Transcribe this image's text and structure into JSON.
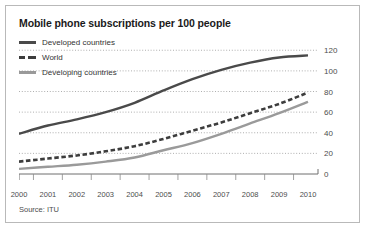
{
  "figure": {
    "title": "Mobile phone subscriptions per 100 people",
    "source": "Source: ITU",
    "border_color": "#b9b9b9",
    "background": "#ffffff"
  },
  "legend": {
    "position": "top-left",
    "items": [
      {
        "label": "Developed countries",
        "color": "#4a4a4a",
        "style": "solid",
        "swatch": "sw-solid-dark"
      },
      {
        "label": "World",
        "color": "#3d3d3d",
        "style": "dashed",
        "swatch": "sw-dashed-dark"
      },
      {
        "label": "Developing countries",
        "color": "#9a9a9a",
        "style": "solid",
        "swatch": "sw-solid-light"
      }
    ]
  },
  "chart_data": {
    "type": "line",
    "title": "Mobile phone subscriptions per 100 people",
    "xlabel": "",
    "ylabel": "",
    "x": [
      2000,
      2001,
      2002,
      2003,
      2004,
      2005,
      2006,
      2007,
      2008,
      2009,
      2010
    ],
    "categories": [
      "2000",
      "2001",
      "2002",
      "2003",
      "2004",
      "2005",
      "2006",
      "2007",
      "2008",
      "2009",
      "2010"
    ],
    "ylim": [
      0,
      128
    ],
    "yticks": [
      0,
      20,
      40,
      60,
      80,
      100,
      120
    ],
    "ytick_labels": [
      "0",
      "20",
      "40",
      "60",
      "80",
      "100",
      "120"
    ],
    "y_axis_position": "right",
    "grid": "horizontal-dotted",
    "legend_position": "top-left",
    "series": [
      {
        "name": "Developed countries",
        "color": "#4a4a4a",
        "style": "solid",
        "values": [
          39,
          47,
          53,
          60,
          69,
          81,
          92,
          101,
          108,
          113,
          115
        ]
      },
      {
        "name": "World",
        "color": "#3d3d3d",
        "style": "dashed",
        "values": [
          12,
          15,
          18,
          22,
          27,
          34,
          42,
          50,
          59,
          68,
          79
        ]
      },
      {
        "name": "Developing countries",
        "color": "#9a9a9a",
        "style": "solid",
        "values": [
          5,
          7,
          9,
          12,
          16,
          23,
          30,
          39,
          49,
          59,
          70
        ]
      }
    ]
  }
}
